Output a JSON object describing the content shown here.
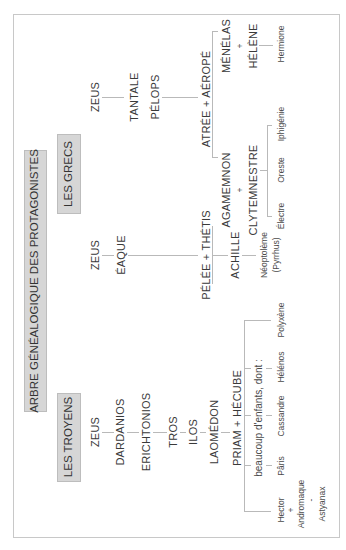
{
  "title": "ARBRE GÉNÉALOGIQUE DES PROTAGONISTES",
  "sections": {
    "greeks": "LES GRECS",
    "trojans": "LES TROYENS"
  },
  "greeks": {
    "atreides_line": {
      "zeus": "ZEUS",
      "tantale": "TANTALE",
      "pelops": "PÉLOPS",
      "couple": "ATRÉE  +  AÉROPÉ",
      "agamemnon": "AGAMEMNON",
      "plus_1": "+",
      "clytemnestre": "CLYTEMNESTRE",
      "menelas": "MÉNÉLAS",
      "plus_2": "+",
      "helene": "HÉLÈNE",
      "children_agamemnon": [
        "Électre",
        "Oreste",
        "Iphigénie"
      ],
      "children_menelas": [
        "Hermione"
      ]
    },
    "aeacid_line": {
      "zeus": "ZEUS",
      "eaque": "ÉAQUE",
      "couple": "PÉLÉE  +  THÉTIS",
      "achille": "ACHILLE",
      "neoptoleme": "Néoptolème",
      "neoptoleme_alias": "(Pyrrhus)"
    }
  },
  "trojans": {
    "lineage": [
      "ZEUS",
      "DARDANIOS",
      "ERICHTONIOS",
      "TROS",
      "ILOS",
      "LAOMÉDON"
    ],
    "couple": "PRIAM  +  HÉCUBE",
    "children_note": "beaucoup d'enfants, dont :",
    "children": [
      "Hector",
      "Pâris",
      "Cassandre",
      "Hélénos",
      "Polyxène"
    ],
    "hector_spouse_plus": "+",
    "hector_spouse": "Andromaque",
    "hector_child_dash": "-",
    "hector_child": "Astyanax"
  },
  "colors": {
    "box_fill": "#d6d6d6",
    "frame": "#c8c8c8",
    "connector": "#b9b9b9",
    "text": "#3a3a3a"
  }
}
